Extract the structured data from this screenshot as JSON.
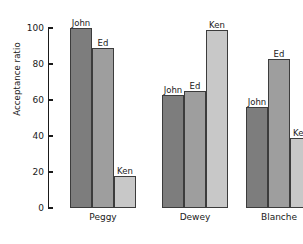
{
  "chart_data": {
    "type": "bar",
    "title": "",
    "xlabel": "",
    "ylabel": "Acceptance ratio",
    "categories": [
      "Peggy",
      "Dewey",
      "Blanche"
    ],
    "series": [
      {
        "name": "John",
        "values": [
          100,
          63,
          56
        ],
        "color": "#7d7d7d"
      },
      {
        "name": "Ed",
        "values": [
          89,
          65,
          83
        ],
        "color": "#9e9e9e"
      },
      {
        "name": "Ken",
        "values": [
          18,
          99,
          39
        ],
        "color": "#c8c8c8"
      }
    ],
    "ylim": [
      0,
      100
    ],
    "yticks": [
      0,
      20,
      40,
      60,
      80,
      100
    ],
    "ytick_labels": [
      "0",
      "20",
      "40",
      "60",
      "80",
      "100"
    ],
    "grid": false,
    "legend": "none",
    "bar_value_labels": true,
    "bar_edge_color": "#3c3c3c",
    "axis_color": "#1a1a1a",
    "background": "#ffffff"
  }
}
